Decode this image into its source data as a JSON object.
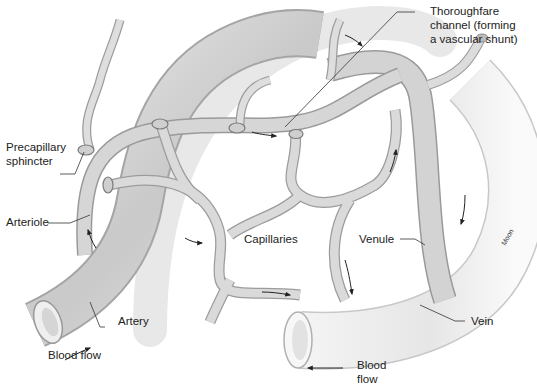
{
  "diagram": {
    "colors": {
      "vessel_fill": "#d9d9d9",
      "vessel_shade": "#b5b5b5",
      "vessel_light": "#eeeeee",
      "outline": "#8a8a8a",
      "leader_line": "#333333",
      "arrow": "#222222",
      "text": "#222222"
    },
    "labels": {
      "thoroughfare": "Thoroughfare channel (forming a vascular shunt)",
      "thoroughfare_line1": "Thoroughfare",
      "thoroughfare_line2": "channel (forming",
      "thoroughfare_line3": "a vascular shunt)",
      "precapillary_line1": "Precapillary",
      "precapillary_line2": "sphincter",
      "arteriole": "Arteriole",
      "capillaries": "Capillaries",
      "venule": "Venule",
      "artery": "Artery",
      "vein": "Vein",
      "blood_flow_left": "Blood flow",
      "blood_flow_right_line1": "Blood",
      "blood_flow_right_line2": "flow",
      "credit": "Moon"
    }
  }
}
